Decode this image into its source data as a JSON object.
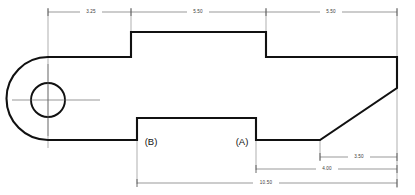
{
  "drawing": {
    "title": "Mechanical Part Orthographic View",
    "background_color": "#ffffff",
    "line_color": "#111111",
    "dimension_color": "#6f6f6f",
    "text_color": "#3a3a3a"
  },
  "dimensions": {
    "top_left": "3.25",
    "top_middle": "5.50",
    "top_right": "5.50",
    "right_upper": "3.50",
    "right_lower": "4.00",
    "bottom_overall": "10.50"
  },
  "datums": {
    "a": "(A)",
    "b": "(B)"
  },
  "features": {
    "hole_label": "through-hole",
    "chamfer_label": "chamfer",
    "boss_label": "raised-boss",
    "notch_label": "bottom-notch",
    "round_end_label": "rounded-end"
  }
}
